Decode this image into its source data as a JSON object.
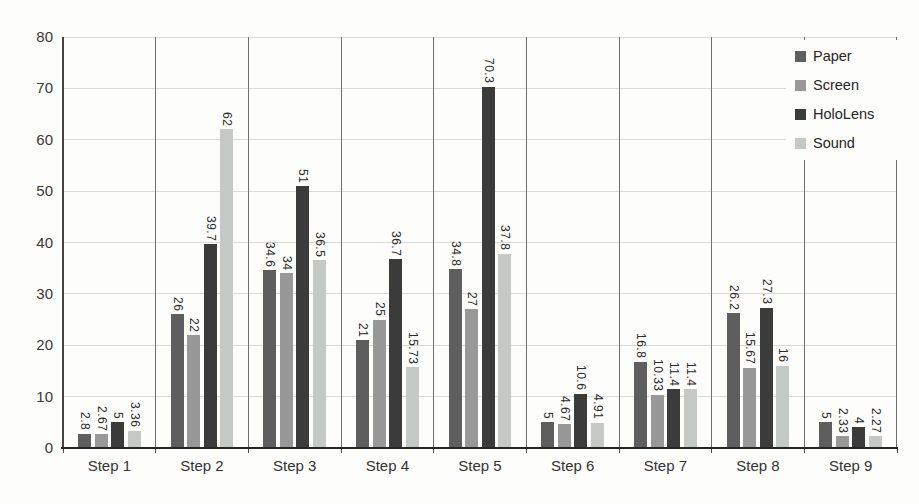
{
  "chart_data": {
    "type": "bar",
    "title": "",
    "xlabel": "",
    "ylabel": "",
    "categories": [
      "Step 1",
      "Step 2",
      "Step 3",
      "Step 4",
      "Step 5",
      "Step 6",
      "Step 7",
      "Step 8",
      "Step 9"
    ],
    "series": [
      {
        "name": "Paper",
        "color": "#5e5e5e",
        "values": [
          2.8,
          26,
          34.6,
          21,
          34.8,
          5,
          16.8,
          26.2,
          5
        ]
      },
      {
        "name": "Screen",
        "color": "#989898",
        "values": [
          2.67,
          22,
          34,
          25,
          27,
          4.67,
          10.33,
          15.67,
          2.33
        ]
      },
      {
        "name": "HoloLens",
        "color": "#3b3b3b",
        "values": [
          5,
          39.7,
          51,
          36.7,
          70.3,
          10.6,
          11.4,
          27.3,
          4
        ]
      },
      {
        "name": "Sound",
        "color": "#c6c8c5",
        "values": [
          3.36,
          62,
          36.5,
          15.73,
          37.8,
          4.91,
          11.4,
          16,
          2.27
        ]
      }
    ],
    "data_labels": true,
    "data_label_rotation": "vertical-top-to-bottom",
    "ylim": [
      0,
      80
    ],
    "yticks": [
      0,
      10,
      20,
      30,
      40,
      50,
      60,
      70,
      80
    ],
    "grid": true,
    "category_separators": true,
    "legend_position": "top-right",
    "legend_entries": [
      "Paper",
      "Screen",
      "HoloLens",
      "Sound"
    ]
  }
}
